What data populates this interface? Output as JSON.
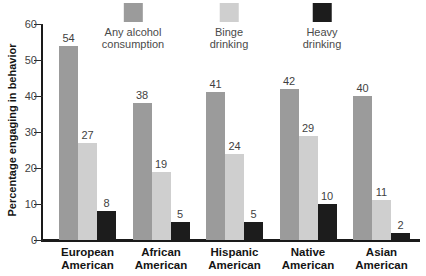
{
  "y_axis": {
    "label": "Percentage engaging in behavior"
  },
  "legend": {
    "entries": [
      {
        "id": "any-alcohol-consumption",
        "line1": "Any alcohol",
        "line2": "consumption",
        "color": "#9b9b9b"
      },
      {
        "id": "binge-drinking",
        "line1": "Binge",
        "line2": "drinking",
        "color": "#cfcfcf"
      },
      {
        "id": "heavy-drinking",
        "line1": "Heavy",
        "line2": "drinking",
        "color": "#1c1c1c"
      }
    ]
  },
  "chart_data": {
    "type": "bar",
    "title": "",
    "xlabel": "",
    "ylabel": "Percentage engaging in behavior",
    "ylim": [
      0,
      60
    ],
    "yticks": [
      0,
      10,
      20,
      30,
      40,
      50,
      60
    ],
    "grid": false,
    "legend_position": "top",
    "bar_value_labels": true,
    "categories": [
      "European American",
      "African American",
      "Hispanic American",
      "Native American",
      "Asian American"
    ],
    "series": [
      {
        "name": "Any alcohol consumption",
        "color": "#9b9b9b",
        "values": [
          54,
          38,
          41,
          42,
          40
        ]
      },
      {
        "name": "Binge drinking",
        "color": "#cfcfcf",
        "values": [
          27,
          19,
          24,
          29,
          11
        ]
      },
      {
        "name": "Heavy drinking",
        "color": "#1c1c1c",
        "values": [
          8,
          5,
          5,
          10,
          2
        ]
      }
    ]
  },
  "colors": {
    "background": "#ffffff",
    "axis": "#1a1a1a",
    "tick_text": "#3f3f3f",
    "value_text": "#3f3f3f",
    "category_text": "#141414",
    "legend_text": "#4a4a4a"
  }
}
